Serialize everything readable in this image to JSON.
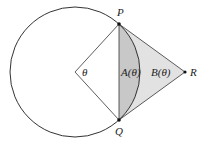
{
  "diagram": {
    "labels": {
      "P": "P",
      "Q": "Q",
      "R": "R",
      "theta": "θ",
      "A": "A(θ)",
      "B": "B(θ)"
    },
    "colors": {
      "stroke": "#333333",
      "segment_fill": "#c8c8c8",
      "triangle_fill": "#e2e2e2",
      "point": "#111111"
    }
  }
}
